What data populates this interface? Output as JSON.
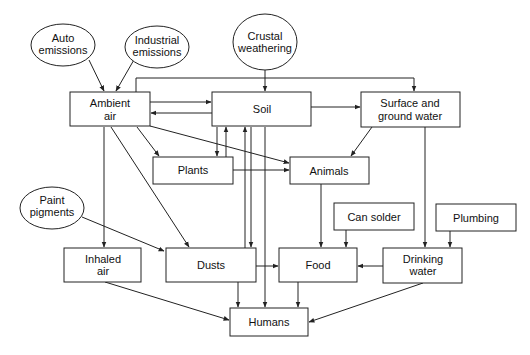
{
  "diagram": {
    "type": "flow",
    "nodes": {
      "auto": {
        "lines": [
          "Auto",
          "emissions"
        ],
        "shape": "ellipse"
      },
      "industrial": {
        "lines": [
          "Industrial",
          "emissions"
        ],
        "shape": "ellipse"
      },
      "crustal": {
        "lines": [
          "Crustal",
          "weathering"
        ],
        "shape": "ellipse"
      },
      "ambient": {
        "lines": [
          "Ambient",
          "air"
        ],
        "shape": "box"
      },
      "soil": {
        "lines": [
          "Soil"
        ],
        "shape": "box"
      },
      "surface": {
        "lines": [
          "Surface and",
          "ground water"
        ],
        "shape": "box"
      },
      "plants": {
        "lines": [
          "Plants"
        ],
        "shape": "box"
      },
      "animals": {
        "lines": [
          "Animals"
        ],
        "shape": "box"
      },
      "paint": {
        "lines": [
          "Paint",
          "pigments"
        ],
        "shape": "ellipse"
      },
      "inhaled": {
        "lines": [
          "Inhaled",
          "air"
        ],
        "shape": "box"
      },
      "dusts": {
        "lines": [
          "Dusts"
        ],
        "shape": "box"
      },
      "cansolder": {
        "lines": [
          "Can solder"
        ],
        "shape": "box"
      },
      "plumbing": {
        "lines": [
          "Plumbing"
        ],
        "shape": "box"
      },
      "food": {
        "lines": [
          "Food"
        ],
        "shape": "box"
      },
      "drinking": {
        "lines": [
          "Drinking",
          "water"
        ],
        "shape": "box"
      },
      "humans": {
        "lines": [
          "Humans"
        ],
        "shape": "box"
      }
    },
    "edges": [
      [
        "Auto emissions",
        "Ambient air"
      ],
      [
        "Industrial emissions",
        "Ambient air"
      ],
      [
        "Crustal weathering",
        "Soil"
      ],
      [
        "Ambient air",
        "Surface and ground water"
      ],
      [
        "Ambient air",
        "Soil"
      ],
      [
        "Soil",
        "Ambient air"
      ],
      [
        "Soil",
        "Surface and ground water"
      ],
      [
        "Ambient air",
        "Plants"
      ],
      [
        "Ambient air",
        "Animals"
      ],
      [
        "Ambient air",
        "Inhaled air"
      ],
      [
        "Ambient air",
        "Dusts"
      ],
      [
        "Soil",
        "Plants"
      ],
      [
        "Plants",
        "Soil"
      ],
      [
        "Dusts",
        "Soil"
      ],
      [
        "Soil",
        "Dusts"
      ],
      [
        "Soil",
        "Humans"
      ],
      [
        "Plants",
        "Animals"
      ],
      [
        "Surface and ground water",
        "Animals"
      ],
      [
        "Surface and ground water",
        "Drinking water"
      ],
      [
        "Paint pigments",
        "Dusts"
      ],
      [
        "Animals",
        "Food"
      ],
      [
        "Can solder",
        "Food"
      ],
      [
        "Plumbing",
        "Drinking water"
      ],
      [
        "Dusts",
        "Food"
      ],
      [
        "Drinking water",
        "Food"
      ],
      [
        "Inhaled air",
        "Humans"
      ],
      [
        "Dusts",
        "Humans"
      ],
      [
        "Food",
        "Humans"
      ],
      [
        "Drinking water",
        "Humans"
      ]
    ]
  }
}
